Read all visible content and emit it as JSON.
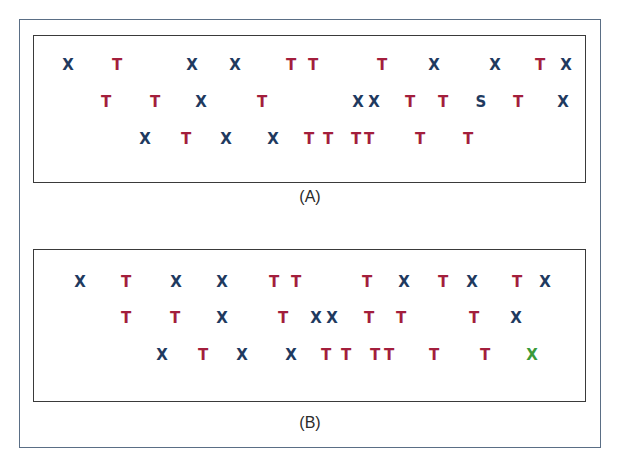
{
  "colors": {
    "X": "#1f3a5f",
    "T": "#a31e3c",
    "S": "#1f3a5f",
    "X_highlight": "#3a9a3a",
    "outer_border": "#5a6e85",
    "panel_border": "#3a3a3a"
  },
  "panels": [
    {
      "id": "A",
      "caption": "(A)",
      "caption_pos": {
        "x": 310,
        "y": 197
      },
      "rows": [
        {
          "y": 65,
          "items": [
            {
              "char": "X",
              "x": 68
            },
            {
              "char": "T",
              "x": 117
            },
            {
              "char": "X",
              "x": 192
            },
            {
              "char": "X",
              "x": 235
            },
            {
              "char": "T",
              "x": 291
            },
            {
              "char": "T",
              "x": 313
            },
            {
              "char": "T",
              "x": 382
            },
            {
              "char": "X",
              "x": 434
            },
            {
              "char": "X",
              "x": 495
            },
            {
              "char": "T",
              "x": 540
            },
            {
              "char": "X",
              "x": 566
            }
          ]
        },
        {
          "y": 102,
          "items": [
            {
              "char": "T",
              "x": 106
            },
            {
              "char": "T",
              "x": 155
            },
            {
              "char": "X",
              "x": 201
            },
            {
              "char": "T",
              "x": 262
            },
            {
              "char": "X",
              "x": 358
            },
            {
              "char": "X",
              "x": 374
            },
            {
              "char": "T",
              "x": 410
            },
            {
              "char": "T",
              "x": 443
            },
            {
              "char": "S",
              "x": 481
            },
            {
              "char": "T",
              "x": 518
            },
            {
              "char": "X",
              "x": 563
            }
          ]
        },
        {
          "y": 139,
          "items": [
            {
              "char": "X",
              "x": 145
            },
            {
              "char": "T",
              "x": 186
            },
            {
              "char": "X",
              "x": 226
            },
            {
              "char": "X",
              "x": 273
            },
            {
              "char": "T",
              "x": 309
            },
            {
              "char": "T",
              "x": 328
            },
            {
              "char": "T",
              "x": 356
            },
            {
              "char": "T",
              "x": 369
            },
            {
              "char": "T",
              "x": 420
            },
            {
              "char": "T",
              "x": 468
            }
          ]
        }
      ]
    },
    {
      "id": "B",
      "caption": "(B)",
      "caption_pos": {
        "x": 310,
        "y": 423
      },
      "rows": [
        {
          "y": 282,
          "items": [
            {
              "char": "X",
              "x": 80
            },
            {
              "char": "T",
              "x": 126
            },
            {
              "char": "X",
              "x": 176
            },
            {
              "char": "X",
              "x": 222
            },
            {
              "char": "T",
              "x": 274
            },
            {
              "char": "T",
              "x": 296
            },
            {
              "char": "T",
              "x": 367
            },
            {
              "char": "X",
              "x": 404
            },
            {
              "char": "T",
              "x": 443
            },
            {
              "char": "X",
              "x": 472
            },
            {
              "char": "T",
              "x": 517
            },
            {
              "char": "X",
              "x": 545
            }
          ]
        },
        {
          "y": 318,
          "items": [
            {
              "char": "T",
              "x": 126
            },
            {
              "char": "T",
              "x": 175
            },
            {
              "char": "X",
              "x": 222
            },
            {
              "char": "T",
              "x": 283
            },
            {
              "char": "X",
              "x": 316
            },
            {
              "char": "X",
              "x": 332
            },
            {
              "char": "T",
              "x": 369
            },
            {
              "char": "T",
              "x": 401
            },
            {
              "char": "T",
              "x": 474
            },
            {
              "char": "X",
              "x": 516
            }
          ]
        },
        {
          "y": 355,
          "items": [
            {
              "char": "X",
              "x": 162
            },
            {
              "char": "T",
              "x": 203
            },
            {
              "char": "X",
              "x": 242
            },
            {
              "char": "X",
              "x": 291
            },
            {
              "char": "T",
              "x": 326
            },
            {
              "char": "T",
              "x": 346
            },
            {
              "char": "T",
              "x": 375
            },
            {
              "char": "T",
              "x": 389
            },
            {
              "char": "T",
              "x": 434
            },
            {
              "char": "T",
              "x": 485
            },
            {
              "char": "X",
              "x": 532,
              "highlight": true
            }
          ]
        }
      ]
    }
  ]
}
